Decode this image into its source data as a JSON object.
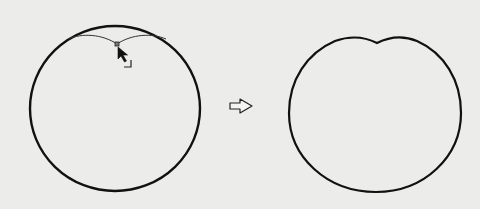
{
  "diagram": {
    "description": "Dragging the top anchor point of a circle downward to create a notch",
    "steps": [
      {
        "name": "before",
        "shape": "circle",
        "state": "top anchor point being dragged down with the Convert Anchor Point cursor",
        "tool_icon": "convert-anchor-point-cursor"
      },
      {
        "name": "after",
        "shape": "circle with notched top (heart-like dip)",
        "state": "result after dragging"
      }
    ],
    "transition_icon": "hollow-right-arrow",
    "colors": {
      "background": "#ececea",
      "stroke": "#111111",
      "guide_stroke": "#333333"
    }
  }
}
